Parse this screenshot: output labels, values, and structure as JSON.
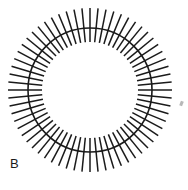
{
  "figure": {
    "panel_label": "B",
    "caption": "",
    "background_color": "#ffffff",
    "stroke_color": "#1a1a1a"
  },
  "chart_data": {
    "type": "scatter",
    "title": "",
    "subtitle": "",
    "xlabel": "",
    "ylabel": "",
    "legend": [],
    "annotations": [
      "B"
    ],
    "grid": false,
    "geometry": {
      "center_x": 90,
      "center_y": 90,
      "ring_radius": 62,
      "spoke_inner_radius": 48,
      "spoke_outer_radius": 82,
      "spoke_count": 64,
      "spoke_start_angle_deg": 0,
      "ring_stroke_width": 1.6,
      "spoke_stroke_width": 1.5
    },
    "x": [],
    "values": []
  }
}
